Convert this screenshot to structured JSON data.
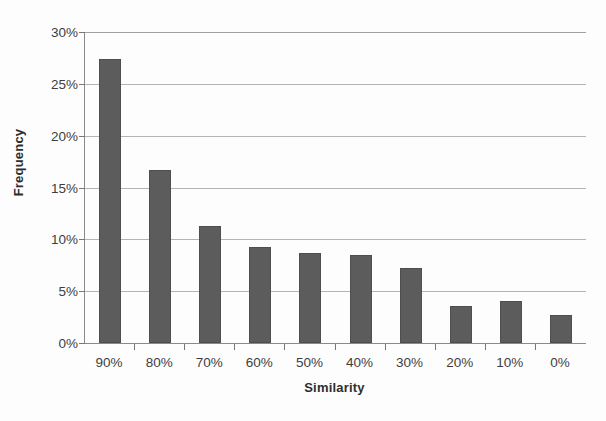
{
  "chart_data": {
    "type": "bar",
    "title": "",
    "xlabel": "Similarity",
    "ylabel": "Frequency",
    "categories": [
      "90%",
      "80%",
      "70%",
      "60%",
      "50%",
      "40%",
      "30%",
      "20%",
      "10%",
      "0%"
    ],
    "values": [
      27.4,
      16.7,
      11.3,
      9.3,
      8.7,
      8.5,
      7.2,
      3.6,
      4.1,
      2.7
    ],
    "value_unit": "percent",
    "ylim": [
      0,
      30
    ],
    "ytick_values": [
      30,
      25,
      20,
      15,
      10,
      5,
      0
    ],
    "ytick_labels": [
      "30%",
      "25%",
      "20%",
      "15%",
      "10%",
      "5%",
      "0%"
    ],
    "grid": true,
    "grid_axis": "y",
    "legend": false,
    "legend_position": "none",
    "bar_color": "#5c5c5c",
    "gridline_color": "#b4b4b4",
    "axis_color": "#8a8a8a",
    "background_color": "#fdfdfd"
  }
}
